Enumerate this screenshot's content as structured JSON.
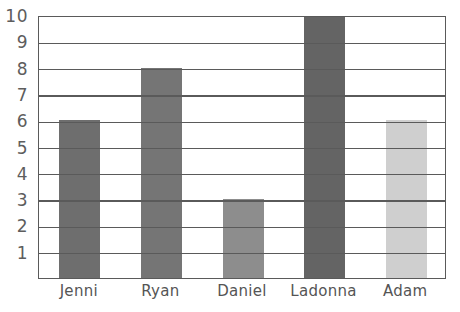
{
  "chart_data": {
    "type": "bar",
    "title": "",
    "xlabel": "",
    "ylabel": "",
    "categories": [
      "Jenni",
      "Ryan",
      "Daniel",
      "Ladonna",
      "Adam"
    ],
    "values": [
      6,
      8,
      3,
      10,
      6
    ],
    "bar_colors": [
      "#6e6e6e",
      "#757575",
      "#8d8d8d",
      "#646464",
      "#cfcfcf"
    ],
    "ylim": [
      0,
      10
    ],
    "y_ticks": [
      "1",
      "2",
      "3",
      "4",
      "5",
      "6",
      "7",
      "8",
      "9",
      "10"
    ],
    "y_tick_values": [
      1,
      2,
      3,
      4,
      5,
      6,
      7,
      8,
      9,
      10
    ],
    "grid": true,
    "grid_axis": "y",
    "legend": false,
    "legend_position": "none",
    "frame_color": "#5a5a5a",
    "background_color": "#ffffff",
    "points": [
      {
        "category": "Jenni",
        "value": 6
      },
      {
        "category": "Ryan",
        "value": 8
      },
      {
        "category": "Daniel",
        "value": 3
      },
      {
        "category": "Ladonna",
        "value": 10
      },
      {
        "category": "Adam",
        "value": 6
      }
    ]
  }
}
